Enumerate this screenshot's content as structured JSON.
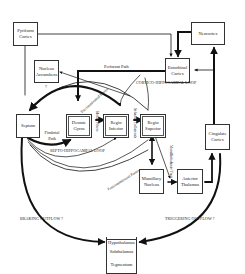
{
  "diagram": {
    "boxes": {
      "pyriform": "Pyriform Cortex",
      "neocortex": "Neocortex",
      "nucleus_accumbens": "Nucleus Accumbens",
      "accumbens_mark": "?",
      "entorhinal": "Entorhinal Cortex",
      "septum": "Septum",
      "dentate": "Dentate Gyrus",
      "regio_inferior": "Regio Inferior",
      "regio_superior": "Regio Superior",
      "cingulate": "Cingulate Cortex",
      "mamillary": "Mamillary Nucleus",
      "anterior_thalamus": "Anterior Thalamus",
      "hypothalamus": "Hypothalamus",
      "subthalamus": "Subthalamus",
      "tegmentum": "Tegmentum"
    },
    "labels": {
      "perforant_path": "Perforant Path",
      "cortico_loop": "CORTICO-HIPPOCAMPAL LOOP",
      "septo_loop": "SEPTO-HIPPOCAMPAL LOOP",
      "fimbrial_path": "Fimbrial Path",
      "precommissural": "Precommissural Fornix",
      "mossy_fibers": "Mossy Fibers",
      "schaffer": "Schaffer Collaterals",
      "postcommissural": "Postcommissural Fornix",
      "mamillothalamic": "Mamillothalamic Tract",
      "braking": "BRAKING OUTFLOW ?",
      "triggering": "TRIGGERING OUTFLOW ?"
    },
    "colors": {
      "line": "#111111",
      "box_border": "#333333",
      "background": "#ffffff"
    }
  }
}
